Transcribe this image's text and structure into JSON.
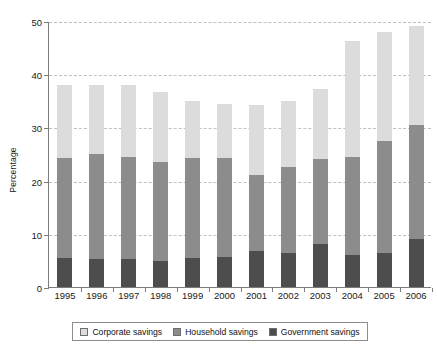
{
  "chart_data": {
    "type": "bar",
    "stacked": true,
    "title": "",
    "xlabel": "",
    "ylabel": "Percentage",
    "ylim": [
      0,
      50
    ],
    "yticks": [
      0,
      10,
      20,
      30,
      40,
      50
    ],
    "ytick_labels": [
      "0",
      "10",
      "20",
      "30",
      "40",
      "50"
    ],
    "grid": true,
    "grid_axis": "y",
    "legend_position": "bottom",
    "categories": [
      "1995",
      "1996",
      "1997",
      "1998",
      "1999",
      "2000",
      "2001",
      "2002",
      "2003",
      "2004",
      "2005",
      "2006"
    ],
    "series": [
      {
        "name": "Government savings",
        "color": "#4d4d4d",
        "values": [
          5.5,
          5.3,
          5.3,
          4.9,
          5.5,
          5.7,
          6.7,
          6.3,
          8.1,
          6.0,
          6.3,
          9.0
        ]
      },
      {
        "name": "Household savings",
        "color": "#8c8c8c",
        "values": [
          18.8,
          19.7,
          19.2,
          18.6,
          18.8,
          18.6,
          14.3,
          16.3,
          15.9,
          18.4,
          21.2,
          21.5
        ]
      },
      {
        "name": "Corporate savings",
        "color": "#dcdcdc",
        "values": [
          13.7,
          13.0,
          13.5,
          13.1,
          10.6,
          10.1,
          13.3,
          12.4,
          13.3,
          21.8,
          20.5,
          18.5
        ]
      }
    ],
    "totals": [
      38.0,
      38.0,
      38.0,
      36.6,
      34.9,
      34.4,
      34.3,
      35.0,
      37.3,
      46.2,
      48.0,
      49.0
    ],
    "stack_order_bottom_to_top": [
      "Government savings",
      "Household savings",
      "Corporate savings"
    ]
  },
  "legend": {
    "items": [
      {
        "label": "Corporate savings",
        "color": "#dcdcdc"
      },
      {
        "label": "Household savings",
        "color": "#8c8c8c"
      },
      {
        "label": "Government savings",
        "color": "#4d4d4d"
      }
    ]
  },
  "colors": {
    "background": "#ffffff",
    "axis": "#7d7d7d",
    "gridline": "#b9c4cc",
    "text": "#1a1a1a"
  }
}
